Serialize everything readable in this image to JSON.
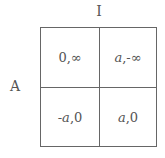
{
  "matrix": {
    "column_player": "I",
    "row_player": "A",
    "cells": [
      [
        {
          "pre": "",
          "var": "",
          "rest": "0,∞"
        },
        {
          "pre": "",
          "var": "a",
          "rest": ",-∞"
        }
      ],
      [
        {
          "pre": "- ",
          "var": "a",
          "rest": ",0"
        },
        {
          "pre": "",
          "var": "a",
          "rest": ",0"
        }
      ]
    ]
  }
}
